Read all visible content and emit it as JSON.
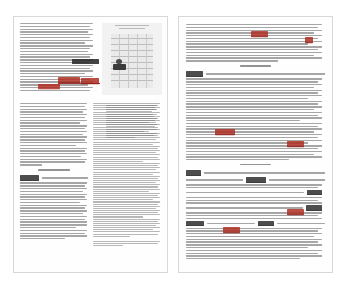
{
  "document": {
    "type": "scanned-annotated-transcript",
    "view": "two-page-spread",
    "page_background": "#fefefe",
    "canvas_background": "#ffffff",
    "ink_color": "#6f6f6f",
    "annotation_color": "#b03024",
    "annotation_ink_secondary": "#2f2f2f"
  },
  "pages": [
    {
      "side": "left",
      "columns": 2,
      "has_figure": true,
      "figure": {
        "name": "grayscale-table-figure",
        "caption_present": true,
        "note_block_present": true
      },
      "annotations": [
        {
          "text": "Edward Felix",
          "color": "#2f2f2f",
          "underline": false
        },
        {
          "text": "Leaking back",
          "color": "#b03024",
          "underline": true
        },
        {
          "text": "the sea was",
          "color": "#b03024",
          "underline": true
        },
        {
          "text": "tradeoffs",
          "color": "#b03024",
          "underline": false
        },
        {
          "text": "Kathy",
          "color": "#b03024",
          "underline": true
        },
        {
          "text": "Lisa",
          "color": "#b03024",
          "underline": true
        },
        {
          "text": "Escape",
          "color": "#2f2f2f",
          "underline": true
        },
        {
          "text": "So are",
          "color": "#b03024",
          "underline": true
        },
        {
          "text": "Ed",
          "color": "#b03024",
          "underline": true
        }
      ],
      "speakers": [
        {
          "name": "Escape"
        },
        {
          "name": "Escape"
        }
      ]
    },
    {
      "side": "right",
      "columns": 1,
      "has_figure": false,
      "centered_interjections": [
        {
          "text": "( Baby ones )"
        },
        {
          "text": "( Baby ones )"
        }
      ],
      "annotations": [
        {
          "text": "Kathy",
          "color": "#b03024",
          "underline": true
        },
        {
          "text": "Ed",
          "color": "#b03024",
          "underline": true
        },
        {
          "text": "Mike says",
          "color": "#b03024",
          "underline": true
        },
        {
          "text": "Kathy",
          "color": "#b03024",
          "underline": true
        },
        {
          "text": "Kathy",
          "color": "#b03024",
          "underline": true
        }
      ],
      "speakers": [
        {
          "name": "Escape"
        },
        {
          "name": "Scott"
        },
        {
          "name": "Escape"
        },
        {
          "name": "Scott"
        },
        {
          "name": "Kathy"
        },
        {
          "name": "Escape"
        },
        {
          "name": "Kathy"
        }
      ]
    }
  ]
}
